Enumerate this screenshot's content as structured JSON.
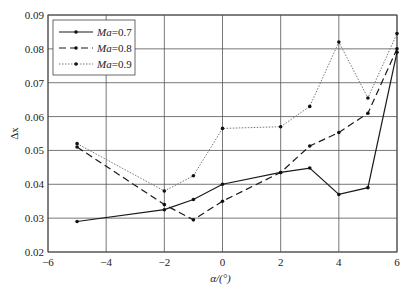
{
  "chart_data": {
    "type": "line",
    "title": "",
    "xlabel": "α/(°)",
    "ylabel": "Δx",
    "xlim": [
      -6,
      6
    ],
    "ylim": [
      0.02,
      0.09
    ],
    "xticks": [
      -6,
      -4,
      -2,
      0,
      2,
      4,
      6
    ],
    "xtick_labels": [
      "−6",
      "−4",
      "−2",
      "0",
      "2",
      "4",
      "6"
    ],
    "yticks": [
      0.02,
      0.03,
      0.04,
      0.05,
      0.06,
      0.07,
      0.08,
      0.09
    ],
    "ytick_labels": [
      "0.02",
      "0.03",
      "0.04",
      "0.05",
      "0.06",
      "0.07",
      "0.08",
      "0.09"
    ],
    "grid": true,
    "legend_position": "upper left",
    "x": [
      -5,
      -2,
      -1,
      0,
      2,
      3,
      4,
      5,
      6
    ],
    "series": [
      {
        "name": "Ma=0.7",
        "name_italic": "Ma",
        "name_rest": "=0.7",
        "style": "solid",
        "values": [
          0.029,
          0.0325,
          0.0355,
          0.04,
          0.0435,
          0.0448,
          0.037,
          0.039,
          0.079
        ]
      },
      {
        "name": "Ma=0.8",
        "name_italic": "Ma",
        "name_rest": "=0.8",
        "style": "dashed",
        "values": [
          0.051,
          0.034,
          0.0295,
          0.035,
          0.0435,
          0.0513,
          0.0553,
          0.061,
          0.08
        ]
      },
      {
        "name": "Ma=0.9",
        "name_italic": "Ma",
        "name_rest": "=0.9",
        "style": "dotted",
        "values": [
          0.052,
          0.038,
          0.0425,
          0.0565,
          0.057,
          0.063,
          0.082,
          0.0655,
          0.0845
        ]
      }
    ],
    "colors": {
      "line": "#1a1a1a",
      "grid": "#555555",
      "dotted": "#777777"
    }
  }
}
